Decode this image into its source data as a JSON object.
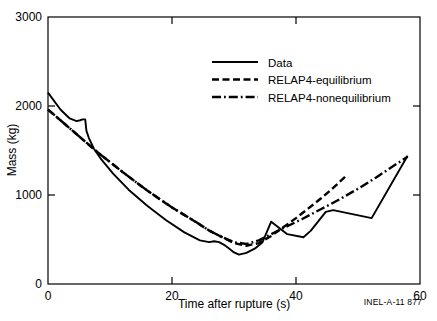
{
  "figure": {
    "top_faint_caption": "",
    "corner_note": "INEL-A-11 877"
  },
  "chart_data": {
    "type": "line",
    "title": "",
    "xlabel": "Time after rupture (s)",
    "ylabel": "Mass (kg)",
    "xlim": [
      0,
      60
    ],
    "ylim": [
      0,
      3000
    ],
    "xticks": [
      0,
      20,
      40,
      60
    ],
    "yticks": [
      0,
      1000,
      2000,
      3000
    ],
    "xtick_labels": [
      "0",
      "20",
      "40",
      "60"
    ],
    "ytick_labels": [
      "0",
      "1000",
      "2000",
      "3000"
    ],
    "grid": false,
    "frame": "box",
    "legend_position": "upper-center-right",
    "series": [
      {
        "name": "Data",
        "style": "solid",
        "color": "#000000",
        "x": [
          0,
          2.0,
          3.5,
          4.6,
          5.2,
          5.6,
          6.0,
          6.2,
          6.6,
          7.4,
          8.6,
          10.5,
          13.0,
          16.0,
          19.0,
          22.0,
          24.5,
          26.0,
          26.8,
          27.6,
          28.4,
          29.2,
          30.0,
          30.8,
          32.0,
          33.4,
          34.6,
          36.0,
          38.6,
          41.2,
          42.4,
          44.8,
          46.0,
          52.2,
          58.0
        ],
        "y": [
          2150,
          1960,
          1860,
          1830,
          1840,
          1850,
          1850,
          1720,
          1640,
          1520,
          1400,
          1240,
          1060,
          880,
          720,
          580,
          490,
          470,
          480,
          470,
          440,
          400,
          355,
          330,
          350,
          400,
          470,
          700,
          560,
          525,
          600,
          810,
          830,
          740,
          1440
        ]
      },
      {
        "name": "RELAP4-equilibrium",
        "style": "dashed",
        "color": "#000000",
        "x": [
          0,
          4,
          8,
          12,
          16,
          20,
          24,
          26,
          28,
          30,
          32,
          34,
          36,
          38,
          40,
          42,
          44,
          46,
          48
        ],
        "y": [
          1960,
          1720,
          1480,
          1260,
          1050,
          860,
          690,
          600,
          530,
          460,
          430,
          460,
          540,
          640,
          740,
          850,
          960,
          1080,
          1210
        ]
      },
      {
        "name": "RELAP4-nonequilibrium",
        "style": "dashdot",
        "color": "#000000",
        "x": [
          0,
          4,
          8,
          12,
          16,
          20,
          24,
          26,
          28,
          30,
          32,
          34,
          36,
          38,
          41,
          44,
          47,
          50,
          53,
          56,
          58
        ],
        "y": [
          1960,
          1720,
          1480,
          1260,
          1050,
          860,
          690,
          600,
          530,
          470,
          450,
          490,
          560,
          630,
          730,
          840,
          950,
          1070,
          1200,
          1340,
          1430
        ]
      }
    ]
  },
  "legend": {
    "items": [
      {
        "label": "Data",
        "style": "solid"
      },
      {
        "label": "RELAP4-equilibrium",
        "style": "dashed"
      },
      {
        "label": "RELAP4-nonequilibrium",
        "style": "dashdot"
      }
    ]
  }
}
